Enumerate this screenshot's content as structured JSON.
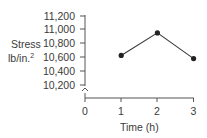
{
  "chart_data": {
    "type": "line",
    "title": "",
    "xlabel": "Time (h)",
    "ylabel": "Stress lb/in.²",
    "ylabel_lines": [
      "Stress",
      "lb/in."
    ],
    "ylabel_superscript": "2",
    "x_ticks": [
      "0",
      "1",
      "2",
      "3"
    ],
    "y_ticks": [
      "11,200",
      "11,000",
      "10,800",
      "10,600",
      "10,400",
      "10,200"
    ],
    "ylim": [
      10200,
      11200
    ],
    "xlim": [
      0,
      3
    ],
    "axis_break": "y-axis break between 0 and 10,200",
    "grid": false,
    "legend": null,
    "x": [
      1,
      2,
      3
    ],
    "series": [
      {
        "name": "Stress",
        "values": [
          10625,
          10950,
          10580
        ],
        "color": "#333333",
        "marker": "circle"
      }
    ]
  }
}
